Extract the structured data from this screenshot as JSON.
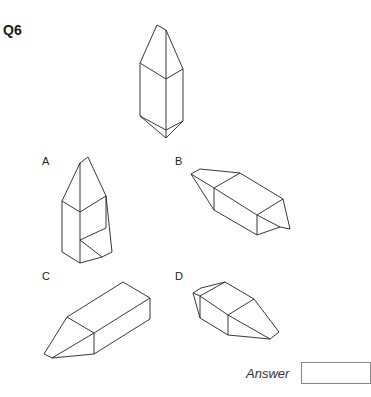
{
  "question": {
    "number": "Q6",
    "figure": "target-crystal-shape"
  },
  "options": [
    {
      "label": "A",
      "figure": "option-a-shape"
    },
    {
      "label": "B",
      "figure": "option-b-shape"
    },
    {
      "label": "C",
      "figure": "option-c-shape"
    },
    {
      "label": "D",
      "figure": "option-d-shape"
    }
  ],
  "answer": {
    "label": "Answer",
    "value": ""
  }
}
